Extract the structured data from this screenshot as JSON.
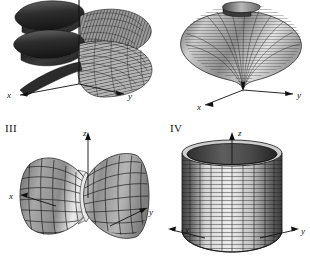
{
  "figure": {
    "title": "",
    "background_color": "#ffffff",
    "ink_color": "#111111",
    "width": 310,
    "height": 268,
    "panel_count": 4
  },
  "panels": [
    {
      "id": "panel-1",
      "roman_label": "",
      "caption": "",
      "surface_name": "helicoid-spiral-ramp",
      "axes": [
        {
          "name": "x",
          "label": "x"
        },
        {
          "name": "y",
          "label": "y"
        }
      ],
      "shading": {
        "light": "#d8d8d8",
        "mid": "#8a8a8a",
        "dark": "#2a2a2a"
      }
    },
    {
      "id": "panel-2",
      "roman_label": "",
      "caption": "",
      "surface_name": "cone-trumpet-surface",
      "axes": [
        {
          "name": "x",
          "label": "x"
        },
        {
          "name": "y",
          "label": "y"
        }
      ],
      "shading": {
        "light": "#dedede",
        "mid": "#9a9a9a",
        "dark": "#3a3a3a"
      }
    },
    {
      "id": "panel-3",
      "roman_label": "III",
      "caption": "III",
      "surface_name": "hyperboloid-of-one-sheet",
      "axes": [
        {
          "name": "x",
          "label": "x"
        },
        {
          "name": "y",
          "label": "y"
        },
        {
          "name": "z",
          "label": "z"
        }
      ],
      "shading": {
        "light": "#e6e6e6",
        "mid": "#9e9e9e",
        "dark": "#4a4a4a"
      }
    },
    {
      "id": "panel-4",
      "roman_label": "IV",
      "caption": "IV",
      "surface_name": "circular-cylinder",
      "axes": [
        {
          "name": "x",
          "label": "x"
        },
        {
          "name": "y",
          "label": "y"
        },
        {
          "name": "z",
          "label": "z"
        }
      ],
      "shading": {
        "light": "#e2e2e2",
        "mid": "#a6a6a6",
        "dark": "#454545"
      }
    }
  ],
  "axis_labels": {
    "panel1_x": "x",
    "panel1_y": "y",
    "panel2_x": "x",
    "panel2_y": "y",
    "panel3_x": "x",
    "panel3_y": "y",
    "panel3_z": "z",
    "panel4_x": "x",
    "panel4_y": "y",
    "panel4_z": "z"
  },
  "roman_numerals": {
    "three": "III",
    "four": "IV"
  }
}
